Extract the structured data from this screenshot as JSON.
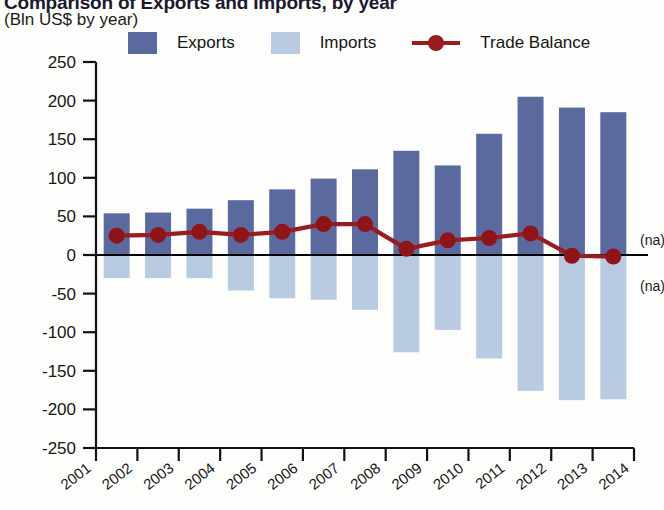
{
  "header": {
    "title": "Comparison of Exports and Imports, by year",
    "subtitle": "(Bln US$ by year)"
  },
  "legend": [
    {
      "label": "Exports",
      "color": "#5b6a9e",
      "type": "swatch",
      "name": "legend-exports"
    },
    {
      "label": "Imports",
      "color": "#b9cbe0",
      "type": "swatch",
      "name": "legend-imports"
    },
    {
      "label": "Trade Balance",
      "color": "#9b1c20",
      "type": "line",
      "name": "legend-trade-balance"
    }
  ],
  "annotations": {
    "na_upper": "(na)",
    "na_lower": "(na)"
  },
  "chart_data": {
    "type": "bar",
    "title": "Comparison of Exports and Imports, by year",
    "subtitle": "(Bln US$ by year)",
    "xlabel": "",
    "ylabel": "Bln US$",
    "ylim": [
      -250,
      250
    ],
    "yticks": [
      250,
      200,
      150,
      100,
      50,
      0,
      -50,
      -100,
      -150,
      -200,
      -250
    ],
    "ytick_labels": [
      "250",
      "200",
      "150",
      "100",
      "50",
      "0",
      "-50",
      "-100",
      "-150",
      "-200",
      "-250"
    ],
    "categories": [
      "2001",
      "2002",
      "2003",
      "2004",
      "2005",
      "2006",
      "2007",
      "2008",
      "2009",
      "2010",
      "2011",
      "2012",
      "2013"
    ],
    "xtick_labels": [
      "2001",
      "2002",
      "2003",
      "2004",
      "2005",
      "2006",
      "2007",
      "2008",
      "2009",
      "2010",
      "2011",
      "2012",
      "2013",
      "2014"
    ],
    "grid": false,
    "legend_position": "top",
    "series": [
      {
        "name": "Exports",
        "type": "bar",
        "color": "#5b6a9e",
        "values": [
          54,
          55,
          60,
          71,
          85,
          99,
          111,
          135,
          116,
          157,
          205,
          191,
          185
        ]
      },
      {
        "name": "Imports",
        "type": "bar",
        "color": "#b9cbe0",
        "values": [
          -30,
          -30,
          -30,
          -46,
          -56,
          -58,
          -71,
          -126,
          -97,
          -134,
          -176,
          -188,
          -187
        ]
      },
      {
        "name": "Trade Balance",
        "type": "line",
        "color": "#9b1c20",
        "values": [
          25,
          26,
          30,
          26,
          30,
          40,
          40,
          8,
          19,
          22,
          28,
          -1,
          -2
        ]
      }
    ]
  }
}
